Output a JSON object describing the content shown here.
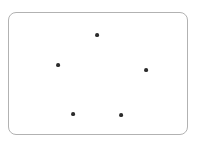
{
  "canvas": {
    "width": 199,
    "height": 143,
    "background_color": "#ffffff"
  },
  "panel": {
    "label": "rounded rectangle frame",
    "x": 8,
    "y": 12,
    "width": 180,
    "height": 123,
    "corner_radius": 8,
    "border_color": "#b2b2b2",
    "border_width": 1,
    "fill_color": "#ffffff"
  },
  "chart_data": {
    "type": "scatter",
    "title": "",
    "subtitle": "",
    "xlabel": "",
    "ylabel": "",
    "xlim": [
      8,
      188
    ],
    "ylim": [
      12,
      135
    ],
    "grid": false,
    "legend": null,
    "axis_ticks": [],
    "tick_labels": [],
    "annotations": [],
    "point_count": 5,
    "point_color": "#2b2b2b",
    "point_radius": 1.9,
    "series": [
      {
        "name": "points",
        "color": "#2b2b2b",
        "points": [
          {
            "name": "point-top",
            "x": 97,
            "y": 35
          },
          {
            "name": "point-left",
            "x": 58,
            "y": 65
          },
          {
            "name": "point-right",
            "x": 146,
            "y": 70
          },
          {
            "name": "point-bottom-left",
            "x": 73,
            "y": 114
          },
          {
            "name": "point-bottom-right",
            "x": 121,
            "y": 115
          }
        ]
      }
    ]
  }
}
